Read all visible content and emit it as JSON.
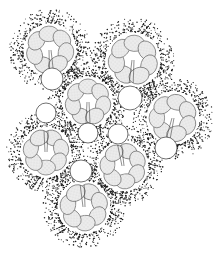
{
  "figure": {
    "colors": {
      "background": "#ffffff",
      "stipple": "#1a1a1a",
      "cell_fill": "#e9e9e9",
      "cell_outline": "#555555",
      "vesicle_fill": "#ffffff"
    },
    "rosettes": [
      {
        "id": "top-left",
        "cx": 50,
        "cy": 50,
        "r": 26,
        "cells": 7,
        "vesicle": {
          "cx": 52,
          "cy": 79,
          "r": 11
        }
      },
      {
        "id": "top-right",
        "cx": 133,
        "cy": 60,
        "r": 27,
        "cells": 7,
        "vesicle": {
          "cx": 130,
          "cy": 98,
          "r": 12
        }
      },
      {
        "id": "center",
        "cx": 88,
        "cy": 102,
        "r": 25,
        "cells": 7,
        "vesicle": {
          "cx": 88,
          "cy": 133,
          "r": 10
        }
      },
      {
        "id": "right",
        "cx": 173,
        "cy": 118,
        "r": 26,
        "cells": 7,
        "vesicle": {
          "cx": 166,
          "cy": 148,
          "r": 11
        }
      },
      {
        "id": "left-middle",
        "cx": 46,
        "cy": 152,
        "r": 25,
        "cells": 7,
        "vesicle": {
          "cx": 46,
          "cy": 113,
          "r": 10
        }
      },
      {
        "id": "center-bottom",
        "cx": 123,
        "cy": 166,
        "r": 25,
        "cells": 7,
        "vesicle": {
          "cx": 118,
          "cy": 134,
          "r": 10
        }
      },
      {
        "id": "bottom",
        "cx": 84,
        "cy": 207,
        "r": 26,
        "cells": 7,
        "vesicle": {
          "cx": 81,
          "cy": 171,
          "r": 11
        }
      }
    ]
  }
}
